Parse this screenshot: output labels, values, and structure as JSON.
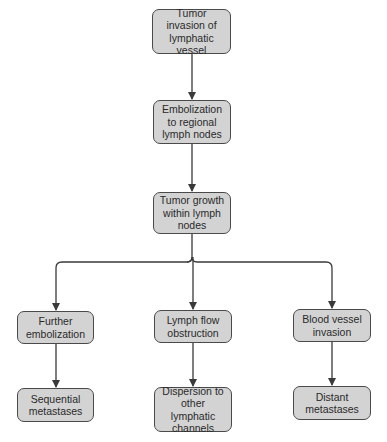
{
  "colors": {
    "node_fill": "#d3d3d3",
    "node_border": "#4a4a4a",
    "text": "#2a2a2a",
    "connector": "#3a3a3a",
    "background": "#ffffff"
  },
  "nodes": {
    "n1": {
      "label": "Tumor invasion of lymphatic vessel"
    },
    "n2": {
      "label": "Embolization to regional lymph nodes"
    },
    "n3": {
      "label": "Tumor growth within lymph nodes"
    },
    "n4": {
      "label": "Further embolization"
    },
    "n5": {
      "label": "Lymph flow obstruction"
    },
    "n6": {
      "label": "Blood vessel invasion"
    },
    "n7": {
      "label": "Sequential metastases"
    },
    "n8": {
      "label": "Dispersion to other lymphatic channels"
    },
    "n9": {
      "label": "Distant metastases"
    }
  },
  "edges": [
    {
      "from": "n1",
      "to": "n2"
    },
    {
      "from": "n2",
      "to": "n3"
    },
    {
      "from": "n3",
      "to": "n4"
    },
    {
      "from": "n3",
      "to": "n5"
    },
    {
      "from": "n3",
      "to": "n6"
    },
    {
      "from": "n4",
      "to": "n7"
    },
    {
      "from": "n5",
      "to": "n8"
    },
    {
      "from": "n6",
      "to": "n9"
    }
  ]
}
